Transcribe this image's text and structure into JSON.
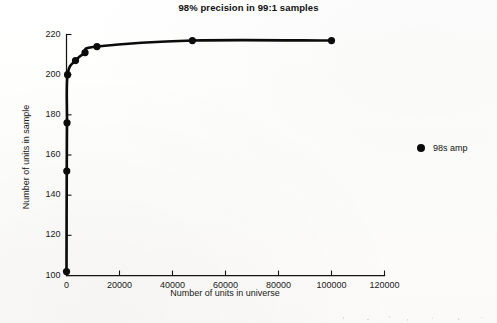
{
  "chart_data": {
    "type": "line",
    "title": "98% precision in 99:1 samples",
    "xlabel": "Number of units in universe",
    "ylabel": "Number of units in sample",
    "xlim": [
      0,
      120000
    ],
    "ylim": [
      100,
      220
    ],
    "xticks": [
      0,
      20000,
      40000,
      60000,
      80000,
      100000,
      120000
    ],
    "xtick_labels": [
      "0",
      "20000",
      "40000",
      "60000",
      "80000",
      "100000",
      "120000"
    ],
    "yticks": [
      100,
      120,
      140,
      160,
      180,
      200,
      220
    ],
    "ytick_labels": [
      "100",
      "120",
      "140",
      "160",
      "180",
      "200",
      "220"
    ],
    "grid": false,
    "legend_position": "right",
    "marker": "filled-circle",
    "series": [
      {
        "name": "98s amp",
        "color": "#0b0b0b",
        "x": [
          0,
          100,
          200,
          400,
          3400,
          7000,
          11500,
          47500,
          100000
        ],
        "values": [
          102,
          152,
          176,
          200,
          207,
          211,
          214,
          217,
          217
        ]
      }
    ]
  },
  "legend": {
    "entries": [
      {
        "marker_icon": "filled-circle-icon",
        "label": "98s amp"
      }
    ]
  }
}
